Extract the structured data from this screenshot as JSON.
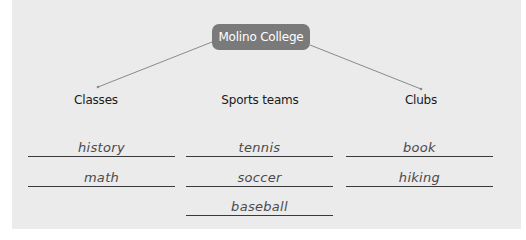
{
  "root": {
    "label": "Molino College"
  },
  "categories": [
    {
      "label": "Classes",
      "items": [
        "history",
        "math"
      ]
    },
    {
      "label": "Sports teams",
      "items": [
        "tennis",
        "soccer",
        "baseball"
      ]
    },
    {
      "label": "Clubs",
      "items": [
        "book",
        "hiking"
      ]
    }
  ],
  "colors": {
    "panel": "#ebebeb",
    "root_box": "#7a7a7a",
    "connector": "#8a8a8a"
  }
}
